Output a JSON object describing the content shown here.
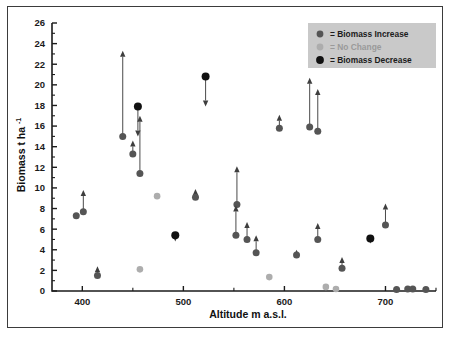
{
  "chart_data": {
    "type": "scatter",
    "title": "",
    "xlabel": "Altitude m a.s.l.",
    "ylabel": "Biomass t ha",
    "ylabel_sup": "-1",
    "xlim": [
      370,
      750
    ],
    "ylim": [
      0,
      26
    ],
    "xticks": [
      400,
      500,
      600,
      700
    ],
    "xtick_labels": [
      "400",
      "500",
      "600",
      "700"
    ],
    "x_minor_step": 50,
    "yticks": [
      0,
      2,
      4,
      6,
      8,
      10,
      12,
      14,
      16,
      18,
      20,
      22,
      24,
      26
    ],
    "ytick_labels": [
      "0",
      "2",
      "4",
      "6",
      "8",
      "10",
      "12",
      "14",
      "16",
      "18",
      "20",
      "22",
      "24",
      "26"
    ],
    "y_minor_step": 1,
    "grid": false,
    "legend_position": "top-right",
    "legend": [
      {
        "key": "increase",
        "label": "= Biomass Increase",
        "color": "#555555"
      },
      {
        "key": "nochange",
        "label": "= No Change",
        "color": "#adadad"
      },
      {
        "key": "decrease",
        "label": "= Biomass Decrease",
        "color": "#111111"
      }
    ],
    "points": [
      {
        "x": 394,
        "y": 7.3,
        "y2": 7.3,
        "cat": "increase"
      },
      {
        "x": 401,
        "y": 7.7,
        "y2": 9.8,
        "cat": "increase"
      },
      {
        "x": 415,
        "y": 1.5,
        "y2": 2.4,
        "cat": "increase"
      },
      {
        "x": 440,
        "y": 15.0,
        "y2": 23.3,
        "cat": "increase"
      },
      {
        "x": 450,
        "y": 13.3,
        "y2": 14.6,
        "cat": "increase"
      },
      {
        "x": 455,
        "y": 17.9,
        "y2": 15.0,
        "cat": "decrease"
      },
      {
        "x": 457,
        "y": 11.4,
        "y2": 17.0,
        "cat": "increase"
      },
      {
        "x": 474,
        "y": 9.2,
        "y2": 9.2,
        "cat": "nochange"
      },
      {
        "x": 492,
        "y": 5.4,
        "y2": 4.8,
        "cat": "decrease"
      },
      {
        "x": 512,
        "y": 9.1,
        "y2": 9.9,
        "cat": "increase"
      },
      {
        "x": 522,
        "y": 20.8,
        "y2": 17.9,
        "cat": "decrease"
      },
      {
        "x": 457,
        "y": 2.1,
        "y2": 2.1,
        "cat": "nochange"
      },
      {
        "x": 553,
        "y": 8.4,
        "y2": 12.1,
        "cat": "increase"
      },
      {
        "x": 552,
        "y": 5.4,
        "y2": 8.3,
        "cat": "increase"
      },
      {
        "x": 563,
        "y": 5.0,
        "y2": 6.7,
        "cat": "increase"
      },
      {
        "x": 572,
        "y": 3.7,
        "y2": 5.4,
        "cat": "increase"
      },
      {
        "x": 585,
        "y": 1.35,
        "y2": 1.35,
        "cat": "nochange"
      },
      {
        "x": 595,
        "y": 15.8,
        "y2": 17.1,
        "cat": "increase"
      },
      {
        "x": 612,
        "y": 3.5,
        "y2": 4.0,
        "cat": "increase"
      },
      {
        "x": 625,
        "y": 15.9,
        "y2": 20.7,
        "cat": "increase"
      },
      {
        "x": 633,
        "y": 15.5,
        "y2": 19.6,
        "cat": "increase"
      },
      {
        "x": 633,
        "y": 5.0,
        "y2": 6.6,
        "cat": "increase"
      },
      {
        "x": 641,
        "y": 0.4,
        "y2": 0.4,
        "cat": "nochange"
      },
      {
        "x": 651,
        "y": 0.2,
        "y2": 0.2,
        "cat": "nochange"
      },
      {
        "x": 657,
        "y": 2.2,
        "y2": 3.3,
        "cat": "increase"
      },
      {
        "x": 685,
        "y": 5.1,
        "y2": 4.6,
        "cat": "decrease"
      },
      {
        "x": 700,
        "y": 6.4,
        "y2": 8.5,
        "cat": "increase"
      },
      {
        "x": 711,
        "y": 0.15,
        "y2": 0.15,
        "cat": "increase"
      },
      {
        "x": 722,
        "y": 0.2,
        "y2": 0.2,
        "cat": "increase"
      },
      {
        "x": 727,
        "y": 0.2,
        "y2": 0.2,
        "cat": "increase"
      },
      {
        "x": 740,
        "y": 0.15,
        "y2": 0.15,
        "cat": "increase"
      }
    ]
  }
}
